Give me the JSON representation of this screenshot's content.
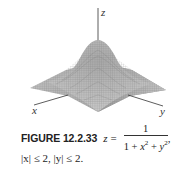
{
  "figure": {
    "axes": {
      "x_label": "x",
      "y_label": "y",
      "z_label": "z"
    },
    "surface": "z = 1 / (1 + x^2 + y^2) over |x| ≤ 2, |y| ≤ 2, rendered as a gray wireframe mesh"
  },
  "caption": {
    "figure_label": "FIGURE 12.2.33",
    "lhs": "z",
    "equals": "=",
    "numerator": "1",
    "denominator_parts": [
      "1 + ",
      "x",
      "2",
      " + ",
      "y",
      "2"
    ],
    "trailing": ",",
    "domain_x": "|x| ≤ 2,",
    "domain_y": "|y| ≤ 2."
  },
  "colors": {
    "mesh_light": "#e4e4e4",
    "mesh_dark": "#8a8a8a",
    "axis": "#333333",
    "text": "#222222"
  }
}
